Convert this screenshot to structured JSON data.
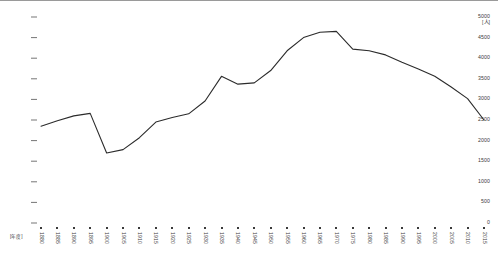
{
  "chart_data": {
    "type": "line",
    "title": "",
    "subtitle": "",
    "xlabel": "",
    "ylabel": "",
    "y_unit": "[人]",
    "x_unit": "[年度]",
    "grid": false,
    "legend": "none",
    "ylim": [
      0,
      5000
    ],
    "y_ticks": [
      0,
      500,
      1000,
      1500,
      2000,
      2500,
      3000,
      3500,
      4000,
      4500,
      5000
    ],
    "y_tick_labels": [
      "0",
      "500",
      "1000",
      "1500",
      "2000",
      "2500",
      "3000",
      "3500",
      "4000",
      "4500",
      "5000"
    ],
    "xlim": [
      1880,
      2015
    ],
    "x_ticks": [
      1880,
      1885,
      1890,
      1895,
      1900,
      1905,
      1910,
      1915,
      1920,
      1925,
      1930,
      1935,
      1940,
      1945,
      1950,
      1955,
      1960,
      1965,
      1970,
      1975,
      1980,
      1985,
      1990,
      1995,
      2000,
      2005,
      2010,
      2015
    ],
    "x_tick_labels": [
      "1880",
      "1885",
      "1890",
      "1895",
      "1900",
      "1905",
      "1910",
      "1915",
      "1920",
      "1925",
      "1930",
      "1935",
      "1940",
      "1945",
      "1950",
      "1955",
      "1960",
      "1965",
      "1970",
      "1975",
      "1980",
      "1985",
      "1990",
      "1995",
      "2000",
      "2005",
      "2010",
      "2015"
    ],
    "categories": [
      1880,
      1885,
      1890,
      1895,
      1900,
      1905,
      1910,
      1915,
      1920,
      1925,
      1930,
      1935,
      1940,
      1945,
      1950,
      1955,
      1960,
      1965,
      1970,
      1975,
      1980,
      1985,
      1990,
      1995,
      2000,
      2005,
      2010,
      2015
    ],
    "values": [
      2350,
      2480,
      2600,
      2660,
      1700,
      1780,
      2070,
      2450,
      2560,
      2650,
      2960,
      3560,
      3370,
      3400,
      3700,
      4180,
      4500,
      4630,
      4650,
      4220,
      4180,
      4080,
      3900,
      3740,
      3560,
      3300,
      3020,
      2500
    ],
    "series": [
      {
        "name": "人口",
        "color": "#2b2b2b",
        "values": [
          2350,
          2480,
          2600,
          2660,
          1700,
          1780,
          2070,
          2450,
          2560,
          2650,
          2960,
          3560,
          3370,
          3400,
          3700,
          4180,
          4500,
          4630,
          4650,
          4220,
          4180,
          4080,
          3900,
          3740,
          3560,
          3300,
          3020,
          2500
        ]
      }
    ],
    "line_color": "#2b2b2b",
    "line_width": 1.1,
    "markers": false,
    "annotations": []
  },
  "axis": {
    "y_unit_label": "[人]",
    "x_unit_label": "[年度]"
  },
  "colors": {
    "line": "#2b2b2b",
    "text": "#3a3a3a",
    "border": "#9a9a9a",
    "background": "#ffffff"
  }
}
